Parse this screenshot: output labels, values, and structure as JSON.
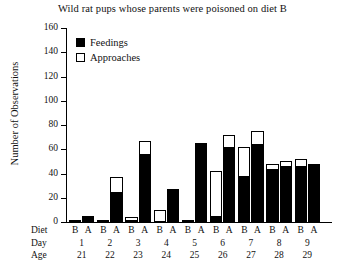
{
  "chart_data": {
    "type": "bar",
    "title": "Wild rat pups whose parents were poisoned on diet B",
    "xlabel": "",
    "ylabel": "Number of Observations",
    "ylim": [
      0,
      160
    ],
    "yticks": [
      0,
      20,
      40,
      60,
      80,
      100,
      120,
      140,
      160
    ],
    "grid": false,
    "legend_position": "top-left",
    "legend": [
      "Feedings",
      "Approaches"
    ],
    "stacked": true,
    "note": "Each day has a Diet B bar and a Diet A bar. Each bar is stacked: black lower segment = Feedings, white upper segment = Approaches. Bar total = Approaches top value.",
    "row_labels": {
      "diet": "Diet",
      "day": "Day",
      "age": "Age"
    },
    "categories": [
      "1",
      "2",
      "3",
      "4",
      "5",
      "6",
      "7",
      "8",
      "9"
    ],
    "age": [
      "21",
      "22",
      "23",
      "24",
      "25",
      "26",
      "27",
      "28",
      "29"
    ],
    "diet_labels": [
      "B",
      "A"
    ],
    "groups": [
      {
        "day": "1",
        "age": "21",
        "B": {
          "feedings": 1,
          "total": 1
        },
        "A": {
          "feedings": 5,
          "total": 5
        }
      },
      {
        "day": "2",
        "age": "22",
        "B": {
          "feedings": 1,
          "total": 2
        },
        "A": {
          "feedings": 25,
          "total": 37
        }
      },
      {
        "day": "3",
        "age": "23",
        "B": {
          "feedings": 1,
          "total": 4
        },
        "A": {
          "feedings": 56,
          "total": 67
        }
      },
      {
        "day": "4",
        "age": "24",
        "B": {
          "feedings": 0,
          "total": 10
        },
        "A": {
          "feedings": 27,
          "total": 27
        }
      },
      {
        "day": "5",
        "age": "25",
        "B": {
          "feedings": 1,
          "total": 2
        },
        "A": {
          "feedings": 65,
          "total": 65
        }
      },
      {
        "day": "6",
        "age": "26",
        "B": {
          "feedings": 5,
          "total": 42
        },
        "A": {
          "feedings": 62,
          "total": 72
        }
      },
      {
        "day": "7",
        "age": "27",
        "B": {
          "feedings": 38,
          "total": 62
        },
        "A": {
          "feedings": 64,
          "total": 75
        }
      },
      {
        "day": "8",
        "age": "28",
        "B": {
          "feedings": 44,
          "total": 48
        },
        "A": {
          "feedings": 46,
          "total": 50
        }
      },
      {
        "day": "9",
        "age": "29",
        "B": {
          "feedings": 46,
          "total": 52
        },
        "A": {
          "feedings": 47,
          "total": 48
        }
      }
    ],
    "series": [
      {
        "name": "Feedings",
        "diet_B": [
          1,
          1,
          1,
          0,
          1,
          5,
          38,
          44,
          46
        ],
        "diet_A": [
          5,
          25,
          56,
          27,
          65,
          62,
          64,
          46,
          47
        ]
      },
      {
        "name": "Approaches",
        "diet_B": [
          1,
          2,
          4,
          10,
          2,
          42,
          62,
          48,
          52
        ],
        "diet_A": [
          5,
          37,
          67,
          27,
          65,
          72,
          75,
          50,
          48
        ]
      }
    ]
  }
}
